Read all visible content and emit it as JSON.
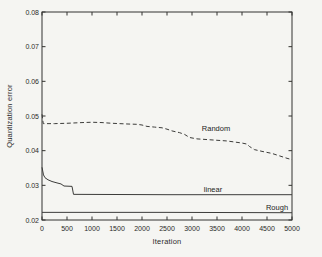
{
  "figure": {
    "background": "#f5f5f2",
    "axis_color": "#333330",
    "tick_text_color": "#2b2b28",
    "plot_box": {
      "left": 42,
      "top": 12,
      "right": 292,
      "bottom": 220
    }
  },
  "chart_data": {
    "type": "line",
    "title": "",
    "xlabel": "Iteration",
    "ylabel": "Quantization error",
    "xlim": [
      0,
      5000
    ],
    "ylim": [
      0.02,
      0.08
    ],
    "grid": false,
    "legend_position": "inline-annotations",
    "xticks": [
      0,
      500,
      1000,
      1500,
      2000,
      2500,
      3000,
      3500,
      4000,
      4500,
      5000
    ],
    "xtick_labels": [
      "0",
      "500",
      "1000",
      "1500",
      "2000",
      "2500",
      "3000",
      "3500",
      "4000",
      "4500",
      "5000"
    ],
    "yticks": [
      0.02,
      0.03,
      0.04,
      0.05,
      0.06,
      0.07,
      0.08
    ],
    "ytick_labels": [
      "0.02",
      "0.03",
      "0.04",
      "0.05",
      "0.06",
      "0.07",
      "0.08"
    ],
    "series": [
      {
        "name": "Random",
        "style": "dashed",
        "color": "#3c3c3a",
        "label_x": 3480,
        "label_y": 0.0466,
        "points": [
          [
            0,
            0.0505
          ],
          [
            25,
            0.0478
          ],
          [
            250,
            0.0478
          ],
          [
            500,
            0.0479
          ],
          [
            800,
            0.0481
          ],
          [
            1000,
            0.0482
          ],
          [
            1200,
            0.0481
          ],
          [
            1400,
            0.0479
          ],
          [
            1700,
            0.0477
          ],
          [
            1900,
            0.0476
          ],
          [
            2000,
            0.0474
          ],
          [
            2100,
            0.047
          ],
          [
            2250,
            0.0468
          ],
          [
            2400,
            0.0466
          ],
          [
            2500,
            0.0462
          ],
          [
            2600,
            0.0457
          ],
          [
            2750,
            0.0452
          ],
          [
            2850,
            0.0447
          ],
          [
            2950,
            0.0438
          ],
          [
            3100,
            0.0434
          ],
          [
            3300,
            0.0432
          ],
          [
            3500,
            0.043
          ],
          [
            3700,
            0.0428
          ],
          [
            3850,
            0.0425
          ],
          [
            4000,
            0.0422
          ],
          [
            4100,
            0.0419
          ],
          [
            4150,
            0.0412
          ],
          [
            4250,
            0.0403
          ],
          [
            4400,
            0.0398
          ],
          [
            4600,
            0.0392
          ],
          [
            4750,
            0.0385
          ],
          [
            4900,
            0.0378
          ],
          [
            5000,
            0.0374
          ]
        ]
      },
      {
        "name": "linear",
        "style": "solid",
        "color": "#3c3c3a",
        "label_x": 3420,
        "label_y": 0.0288,
        "points": [
          [
            0,
            0.0352
          ],
          [
            30,
            0.033
          ],
          [
            60,
            0.0322
          ],
          [
            120,
            0.0316
          ],
          [
            200,
            0.0311
          ],
          [
            300,
            0.0307
          ],
          [
            380,
            0.0304
          ],
          [
            420,
            0.03
          ],
          [
            440,
            0.0298
          ],
          [
            600,
            0.0297
          ],
          [
            630,
            0.0274
          ],
          [
            2500,
            0.0273
          ],
          [
            5000,
            0.0273
          ]
        ]
      },
      {
        "name": "Rough",
        "style": "solid",
        "color": "#3c3c3a",
        "label_x": 4700,
        "label_y": 0.0238,
        "points": [
          [
            0,
            0.0222
          ],
          [
            2500,
            0.0222
          ],
          [
            5000,
            0.0221
          ]
        ]
      }
    ]
  }
}
